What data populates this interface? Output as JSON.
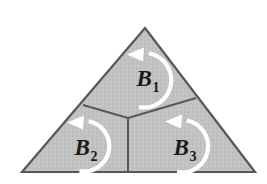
{
  "figure": {
    "background_color": "#ffffff",
    "fill_color": "#c2c2c2",
    "outline_color": "#585858",
    "arrow_color": "#ffffff",
    "label_color": "#1a1a1a",
    "outer_shape": "triangle",
    "vertices": {
      "apex": [
        145,
        28
      ],
      "bottom_left": [
        22,
        172
      ],
      "bottom_right": [
        255,
        172
      ]
    },
    "center_junction": [
      128,
      118
    ],
    "divider_endpoints": {
      "to_left_edge": [
        83,
        105
      ],
      "to_right_edge": [
        196,
        98
      ],
      "to_base": [
        128,
        172
      ]
    },
    "regions": [
      {
        "id": "region-b1",
        "label_base": "B",
        "label_sub": "1",
        "label_full": "B1",
        "position": "top",
        "label_x": 148,
        "label_y": 86,
        "arrow": {
          "direction": "counterclockwise",
          "center_x": 144,
          "center_y": 80,
          "radius": 27,
          "head_x": 140,
          "head_y": 53
        }
      },
      {
        "id": "region-b2",
        "label_base": "B",
        "label_sub": "2",
        "label_full": "B2",
        "position": "bottom-left",
        "label_x": 86,
        "label_y": 155,
        "arrow": {
          "direction": "counterclockwise",
          "center_x": 84,
          "center_y": 146,
          "radius": 25,
          "head_x": 80,
          "head_y": 121
        }
      },
      {
        "id": "region-b3",
        "label_base": "B",
        "label_sub": "3",
        "label_full": "B3",
        "position": "bottom-right",
        "label_x": 185,
        "label_y": 155,
        "arrow": {
          "direction": "counterclockwise",
          "center_x": 182,
          "center_y": 146,
          "radius": 26,
          "head_x": 178,
          "head_y": 120
        }
      }
    ]
  }
}
